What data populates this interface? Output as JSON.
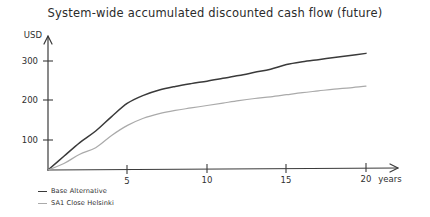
{
  "chart_data": {
    "type": "line",
    "title": "System-wide accumulated discounted cash flow (future)",
    "xlabel": "years",
    "ylabel": "USD",
    "grid": false,
    "legend_position": "bottom-left",
    "xlim": [
      0,
      22
    ],
    "ylim": [
      0,
      360
    ],
    "xticks": [
      5,
      10,
      15,
      20
    ],
    "yticks": [
      100,
      200,
      300
    ],
    "x": [
      0,
      1,
      2,
      3,
      4,
      5,
      6,
      7,
      8,
      9,
      10,
      11,
      12,
      13,
      14,
      15,
      16,
      17,
      18,
      19,
      20
    ],
    "series": [
      {
        "name": "Base Alternative",
        "color": "#3a3a3a",
        "values": [
          0,
          38,
          76,
          108,
          148,
          185,
          207,
          222,
          232,
          240,
          247,
          255,
          263,
          272,
          281,
          294,
          302,
          308,
          314,
          320,
          326
        ]
      },
      {
        "name": "SA1 Close Helsinki",
        "color": "#aaaaaa",
        "values": [
          0,
          18,
          44,
          62,
          96,
          124,
          144,
          157,
          166,
          173,
          180,
          187,
          194,
          200,
          205,
          211,
          217,
          222,
          227,
          231,
          236
        ]
      }
    ]
  },
  "axes": {
    "y_axis_name": "USD",
    "x_axis_name": "years",
    "y_tick_labels": [
      "300",
      "200",
      "100"
    ],
    "x_tick_labels": [
      "5",
      "10",
      "15",
      "20"
    ]
  },
  "legend": {
    "items": [
      {
        "label": "Base Alternative",
        "color": "#3a3a3a"
      },
      {
        "label": "SA1 Close Helsinki",
        "color": "#aaaaaa"
      }
    ]
  }
}
